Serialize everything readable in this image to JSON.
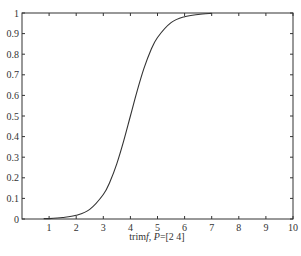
{
  "chart_data": {
    "type": "line",
    "title": "",
    "xlabel": "trimf, P=[2 4]",
    "xlabel_parts": [
      {
        "text": "trim",
        "italic": false
      },
      {
        "text": "f",
        "italic": true
      },
      {
        "text": ", ",
        "italic": false
      },
      {
        "text": "P",
        "italic": true
      },
      {
        "text": "=[2  4]",
        "italic": false
      }
    ],
    "ylabel": "",
    "xlim": [
      0,
      10
    ],
    "ylim": [
      0,
      1
    ],
    "xticks": [
      1,
      2,
      3,
      4,
      5,
      6,
      7,
      8,
      9,
      10
    ],
    "xtick_labels": [
      "1",
      "2",
      "3",
      "4",
      "5",
      "6",
      "7",
      "8",
      "9",
      "10"
    ],
    "yticks": [
      0,
      0.1,
      0.2,
      0.3,
      0.4,
      0.5,
      0.6,
      0.7,
      0.8,
      0.9,
      1
    ],
    "ytick_labels": [
      "0",
      "0.1",
      "0.2",
      "0.3",
      "0.4",
      "0.5",
      "0.6",
      "0.7",
      "0.8",
      "0.9",
      "1"
    ],
    "grid": false,
    "legend": null,
    "series": [
      {
        "name": "membership",
        "color": "#333333",
        "x": [
          0.8,
          1.0,
          1.5,
          2.0,
          2.5,
          3.0,
          3.25,
          3.5,
          3.75,
          4.0,
          4.25,
          4.5,
          4.75,
          5.0,
          5.5,
          6.0,
          6.5,
          7.0
        ],
        "y": [
          0.002,
          0.002,
          0.007,
          0.018,
          0.047,
          0.119,
          0.182,
          0.269,
          0.378,
          0.5,
          0.622,
          0.731,
          0.818,
          0.881,
          0.953,
          0.982,
          0.993,
          0.998
        ]
      }
    ]
  }
}
